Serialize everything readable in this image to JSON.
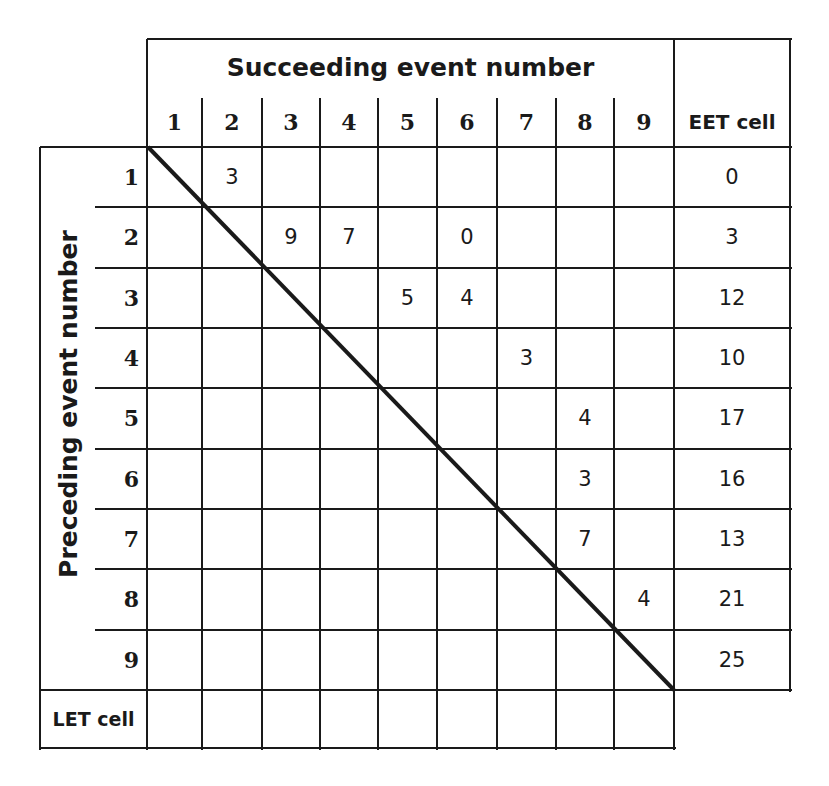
{
  "table": {
    "column_group_title": "Succeeding event number",
    "row_group_title": "Preceding event number",
    "column_headers": [
      "1",
      "2",
      "3",
      "4",
      "5",
      "6",
      "7",
      "8",
      "9"
    ],
    "eet_header": "EET cell",
    "row_headers": [
      "1",
      "2",
      "3",
      "4",
      "5",
      "6",
      "7",
      "8",
      "9"
    ],
    "let_header": "LET cell",
    "durations": [
      {
        "from": 1,
        "to": 2,
        "value": "3"
      },
      {
        "from": 2,
        "to": 3,
        "value": "9"
      },
      {
        "from": 2,
        "to": 4,
        "value": "7"
      },
      {
        "from": 2,
        "to": 6,
        "value": "0"
      },
      {
        "from": 3,
        "to": 5,
        "value": "5"
      },
      {
        "from": 3,
        "to": 6,
        "value": "4"
      },
      {
        "from": 4,
        "to": 7,
        "value": "3"
      },
      {
        "from": 5,
        "to": 8,
        "value": "4"
      },
      {
        "from": 6,
        "to": 8,
        "value": "3"
      },
      {
        "from": 7,
        "to": 8,
        "value": "7"
      },
      {
        "from": 8,
        "to": 9,
        "value": "4"
      }
    ],
    "eet_values": [
      "0",
      "3",
      "12",
      "10",
      "17",
      "16",
      "13",
      "21",
      "25"
    ],
    "let_values": [
      "",
      "",
      "",
      "",
      "",
      "",
      "",
      "",
      ""
    ]
  }
}
